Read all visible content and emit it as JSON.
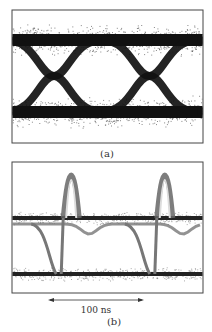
{
  "chart_data": [
    {
      "type": "line",
      "panel_label": "(a)",
      "title": "",
      "xlabel": "",
      "ylabel": "",
      "description": "Eye diagram: noisy two-level signal with two eye crossings",
      "grid": false,
      "x": [
        0,
        0.25,
        0.5,
        0.75,
        1.0
      ],
      "series": [
        {
          "name": "high level",
          "values": [
            1,
            1,
            1,
            1,
            1
          ]
        },
        {
          "name": "low level",
          "values": [
            0,
            0,
            0,
            0,
            0
          ]
        }
      ],
      "crossings_x": [
        0.22,
        0.72
      ],
      "colors": {
        "trace": "#111111",
        "noise": "#555555",
        "frame": "#444444"
      }
    },
    {
      "type": "line",
      "panel_label": "(b)",
      "title": "",
      "xlabel": "",
      "ylabel": "",
      "description": "Pulse train: overshoot spikes on rising edges, two stable levels",
      "grid": false,
      "annotation": {
        "text": "100 ns",
        "kind": "double-arrow"
      },
      "x": [
        0,
        0.25,
        0.5,
        0.75,
        1.0
      ],
      "series": [
        {
          "name": "upper level",
          "values": [
            0.62,
            0.62,
            0.62,
            0.62,
            0.62
          ]
        },
        {
          "name": "lower level",
          "values": [
            0.05,
            0.05,
            0.05,
            0.05,
            0.05
          ]
        }
      ],
      "spikes_x": [
        0.31,
        0.8
      ],
      "colors": {
        "trace": "#222222",
        "noise": "#888888",
        "frame": "#444444"
      }
    }
  ]
}
